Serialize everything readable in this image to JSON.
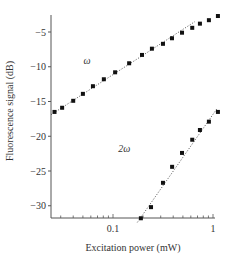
{
  "chart_data": {
    "type": "scatter",
    "title": "",
    "xlabel": "Excitation power (mW)",
    "ylabel": "Fluorescence signal (dB)",
    "xscale": "log",
    "xlim": [
      0.024,
      1.05
    ],
    "ylim": [
      -32,
      -2.5
    ],
    "xticks": [
      {
        "value": 0.1,
        "label": "0.1"
      },
      {
        "value": 1,
        "label": "1"
      }
    ],
    "yticks": [
      {
        "value": -5,
        "label": "−5"
      },
      {
        "value": -10,
        "label": "−10"
      },
      {
        "value": -15,
        "label": "−15"
      },
      {
        "value": -20,
        "label": "−20"
      },
      {
        "value": -25,
        "label": "−25"
      },
      {
        "value": -30,
        "label": "−30"
      }
    ],
    "grid": false,
    "legend": "none",
    "series": [
      {
        "name": "ω",
        "label_pos": {
          "x": 0.055,
          "y": -9.6
        },
        "x": [
          0.026,
          0.031,
          0.04,
          0.05,
          0.063,
          0.081,
          0.105,
          0.145,
          0.195,
          0.245,
          0.316,
          0.389,
          0.49,
          0.62,
          0.74,
          0.91,
          1.12
        ],
        "y": [
          -16.5,
          -15.9,
          -14.9,
          -13.9,
          -12.8,
          -11.8,
          -10.8,
          -9.5,
          -8.3,
          -7.4,
          -6.7,
          -5.9,
          -5.1,
          -4.4,
          -3.8,
          -3.3,
          -2.7
        ],
        "fit": {
          "x": [
            0.024,
            0.66
          ],
          "y": [
            -16.9,
            -3.5
          ],
          "style": "dotted",
          "slope_db_per_decade": 10
        }
      },
      {
        "name": "2ω",
        "label_pos": {
          "x": 0.13,
          "y": -22.3
        },
        "x": [
          0.19,
          0.24,
          0.316,
          0.39,
          0.49,
          0.62,
          0.74,
          0.91,
          1.12
        ],
        "y": [
          -31.8,
          -30.2,
          -26.7,
          -24.4,
          -22.4,
          -20.5,
          -19.1,
          -17.9,
          -16.5
        ],
        "fit": {
          "x": [
            0.175,
            1.1
          ],
          "y": [
            -32.4,
            -16.0
          ],
          "style": "dotted",
          "slope_db_per_decade": 20
        }
      }
    ],
    "annotations": [
      "ω",
      "2ω"
    ]
  }
}
